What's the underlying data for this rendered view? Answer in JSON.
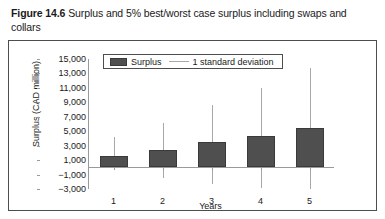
{
  "caption": {
    "figure_number": "Figure 14.6",
    "text": "Surplus and 5% best/worst case surplus including swaps and collars"
  },
  "legend": {
    "position": "top-center-inside",
    "items": [
      {
        "label": "Surplus",
        "marker": "bar-swatch",
        "color": "#4f4f4f"
      },
      {
        "label": "1 standard deviation",
        "marker": "line",
        "color": "#a8a8a8"
      }
    ]
  },
  "chart_data": {
    "type": "bar",
    "title": "Surplus and 5% best/worst case surplus including swaps and collars",
    "xlabel": "Years",
    "ylabel": "Surplus (CAD million)",
    "categories": [
      "1",
      "2",
      "3",
      "4",
      "5"
    ],
    "ylim": [
      -3000,
      15000
    ],
    "ytick_step": 2000,
    "ytick_labels": [
      "15,000",
      "13,000",
      "11,000",
      "9,000",
      "7,000",
      "5,000",
      "3,000",
      "1,000",
      "−1,000",
      "−3,000"
    ],
    "ytick_values": [
      15000,
      13000,
      11000,
      9000,
      7000,
      5000,
      3000,
      1000,
      -1000,
      -3000
    ],
    "grid": false,
    "series": [
      {
        "name": "Surplus",
        "type": "bar",
        "color": "#4f4f4f",
        "values": [
          1600,
          2400,
          3500,
          4400,
          5500
        ]
      },
      {
        "name": "1 standard deviation",
        "type": "errorbar",
        "color": "#a8a8a8",
        "upper": [
          4200,
          6200,
          8700,
          11000,
          13700
        ],
        "lower": [
          -300,
          -1500,
          -2300,
          -2800,
          -3000
        ]
      }
    ]
  }
}
